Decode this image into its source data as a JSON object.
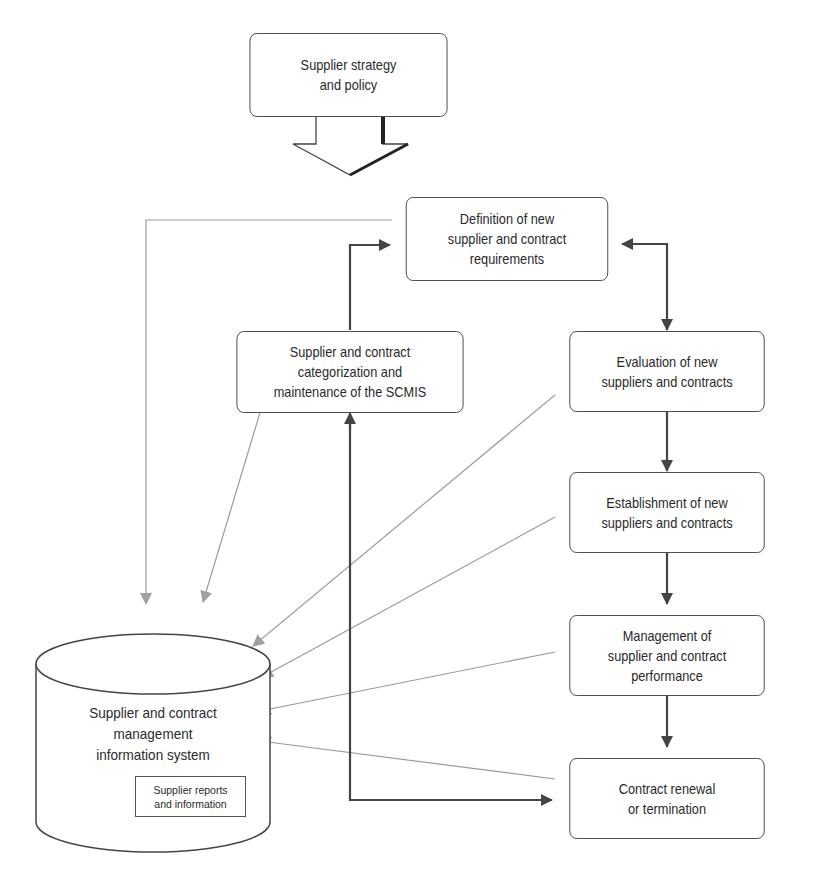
{
  "diagram": {
    "type": "flowchart",
    "colors": {
      "primary_stroke": "#444444",
      "info_flow_stroke": "#9a9a9a",
      "background": "#ffffff"
    },
    "nodes": {
      "strategy": {
        "label": "Supplier strategy\nand policy"
      },
      "definition": {
        "label": "Definition of new\nsupplier and contract\nrequirements"
      },
      "categorization": {
        "label": "Supplier and contract\ncategorization and\nmaintenance of the SCMIS"
      },
      "evaluation": {
        "label": "Evaluation of new\nsuppliers and contracts"
      },
      "establishment": {
        "label": "Establishment of new\nsuppliers and contracts"
      },
      "management": {
        "label": "Management of\nsupplier and contract\nperformance"
      },
      "renewal": {
        "label": "Contract renewal\nor termination"
      },
      "scmis": {
        "label": "Supplier and contract\nmanagement\ninformation system"
      },
      "reports": {
        "label": "Supplier reports\nand information"
      }
    },
    "edges": [
      {
        "from": "strategy",
        "to": "definition",
        "style": "block-arrow"
      },
      {
        "from": "definition",
        "to": "evaluation",
        "style": "bidirectional"
      },
      {
        "from": "evaluation",
        "to": "establishment",
        "style": "solid"
      },
      {
        "from": "establishment",
        "to": "management",
        "style": "solid"
      },
      {
        "from": "management",
        "to": "renewal",
        "style": "solid"
      },
      {
        "from": "renewal",
        "to": "categorization",
        "style": "solid-bidirectional"
      },
      {
        "from": "categorization",
        "to": "definition",
        "style": "solid"
      },
      {
        "from": "definition",
        "to": "scmis",
        "style": "info-flow"
      },
      {
        "from": "categorization",
        "to": "scmis",
        "style": "info-flow"
      },
      {
        "from": "evaluation",
        "to": "scmis",
        "style": "info-flow"
      },
      {
        "from": "establishment",
        "to": "scmis",
        "style": "info-flow"
      },
      {
        "from": "management",
        "to": "scmis",
        "style": "info-flow"
      },
      {
        "from": "renewal",
        "to": "scmis",
        "style": "info-flow"
      }
    ]
  }
}
